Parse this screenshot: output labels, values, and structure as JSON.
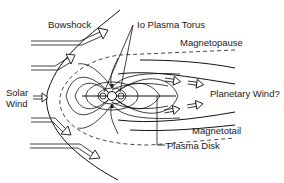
{
  "diagram": {
    "labels": {
      "bowshock": "Bowshock",
      "io_plasma_torus": "Io Plasma Torus",
      "magnetopause": "Magnetopause",
      "solar_wind_line1": "Solar",
      "solar_wind_line2": "Wind",
      "planetary_wind": "Planetary Wind?",
      "magnetotail": "Magnetotail",
      "plasma_disk": "Plasma Disk"
    },
    "colors": {
      "line": "#111111",
      "background": "#ffffff",
      "dashed": "#333333"
    },
    "elements": {
      "solar_wind_arrows": 4,
      "planetary_wind_arrows": 4,
      "planet": "central planet with field lines"
    }
  }
}
